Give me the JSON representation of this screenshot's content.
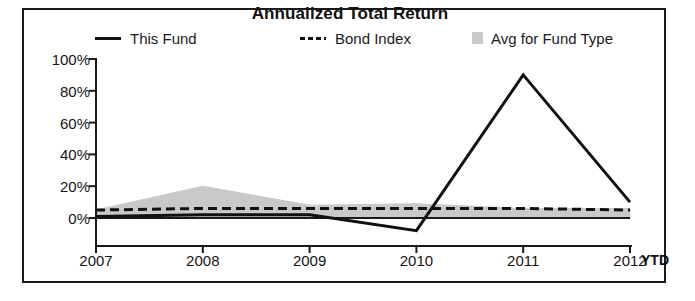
{
  "chart_data": {
    "type": "line",
    "title": "Annualized Total Return",
    "xlabel": "",
    "ylabel": "",
    "xlim": [
      "2007",
      "2012"
    ],
    "ylim": [
      -10,
      100
    ],
    "grid": false,
    "legend_position": "top",
    "x_axis_suffix": "YTD",
    "categories": [
      "2007",
      "2008",
      "2009",
      "2010",
      "2011",
      "2012"
    ],
    "ytick_labels": [
      "100%",
      "80%",
      "60%",
      "40%",
      "20%",
      "0%"
    ],
    "ytick_values": [
      100,
      80,
      60,
      40,
      20,
      0
    ],
    "series": [
      {
        "name": "This Fund",
        "style": "solid",
        "color": "#111111",
        "values": [
          1,
          2,
          2,
          -8,
          90,
          10
        ]
      },
      {
        "name": "Bond Index",
        "style": "dashed",
        "color": "#111111",
        "values": [
          5,
          6,
          6,
          6,
          6,
          5
        ]
      },
      {
        "name": "Avg for Fund Type",
        "style": "area-band",
        "color": "#c9c9c9",
        "values": [
          5,
          20,
          8,
          9,
          6,
          6
        ],
        "band_upper": [
          5,
          20,
          8,
          9,
          6,
          6
        ],
        "band_lower": [
          0,
          0,
          0,
          0,
          0,
          0
        ]
      }
    ],
    "legend": [
      {
        "label": "This Fund",
        "marker": "solid-line",
        "color": "#111111"
      },
      {
        "label": "Bond Index",
        "marker": "dashed-line",
        "color": "#111111"
      },
      {
        "label": "Avg for Fund Type",
        "marker": "area-swatch",
        "color": "#c9c9c9"
      }
    ]
  },
  "colors": {
    "frame": "#1a1a1a",
    "axis": "#1a1a1a",
    "fund_line": "#111111",
    "bond_line": "#111111",
    "avg_band": "#c9c9c9",
    "text": "#151515",
    "background": "#ffffff"
  }
}
